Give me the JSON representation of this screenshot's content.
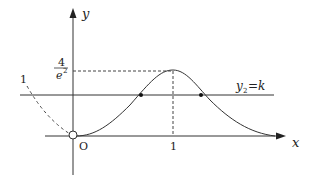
{
  "diagram": {
    "axes": {
      "x_label": "x",
      "y_label": "y",
      "origin_label": "O"
    },
    "ticks": {
      "x_one": "1",
      "y_peak_num": "4",
      "y_peak_den": "e",
      "y_peak_den_exp": "2"
    },
    "left_label": "1",
    "line_label": {
      "main": "y",
      "sub": "2",
      "rest": "=k"
    },
    "colors": {
      "stroke": "#333333",
      "background": "#ffffff"
    }
  }
}
